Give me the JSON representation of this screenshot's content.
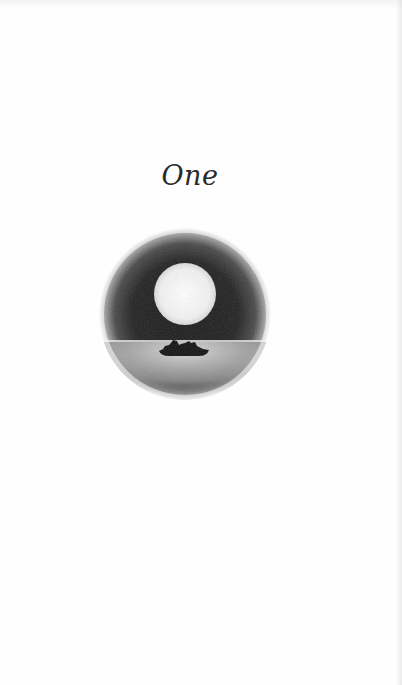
{
  "page": {
    "chapter_title": "One",
    "illustration": {
      "type": "circular-vignette",
      "description": "Full moon over water with a small boat silhouette",
      "colors": {
        "sky": "#1c1c1c",
        "moon": "#f4f4f4",
        "water_glow": "#d8d8d8",
        "boat": "#111111",
        "paper": "#fefefe"
      }
    }
  }
}
